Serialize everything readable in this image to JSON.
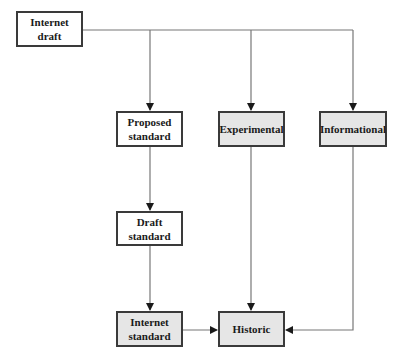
{
  "diagram": {
    "title": "",
    "colors": {
      "line": "#777777",
      "border": "#3a3a3a",
      "shaded_fill": "#e6e6e6",
      "plain_fill": "#ffffff",
      "text": "#1a1a1a"
    },
    "nodes": [
      {
        "id": "internet-draft",
        "label_line1": "Internet",
        "label_line2": "draft",
        "shaded": false
      },
      {
        "id": "proposed-standard",
        "label_line1": "Proposed",
        "label_line2": "standard",
        "shaded": false
      },
      {
        "id": "experimental",
        "label_line1": "Experimental",
        "label_line2": "",
        "shaded": true
      },
      {
        "id": "informational",
        "label_line1": "Informational",
        "label_line2": "",
        "shaded": true
      },
      {
        "id": "draft-standard",
        "label_line1": "Draft",
        "label_line2": "standard",
        "shaded": false
      },
      {
        "id": "internet-standard",
        "label_line1": "Internet",
        "label_line2": "standard",
        "shaded": true
      },
      {
        "id": "historic",
        "label_line1": "Historic",
        "label_line2": "",
        "shaded": true
      }
    ],
    "edges": [
      {
        "from": "internet-draft",
        "to": "proposed-standard"
      },
      {
        "from": "internet-draft",
        "to": "experimental"
      },
      {
        "from": "internet-draft",
        "to": "informational"
      },
      {
        "from": "proposed-standard",
        "to": "draft-standard"
      },
      {
        "from": "draft-standard",
        "to": "internet-standard"
      },
      {
        "from": "internet-standard",
        "to": "historic"
      },
      {
        "from": "experimental",
        "to": "historic"
      },
      {
        "from": "informational",
        "to": "historic"
      }
    ]
  }
}
